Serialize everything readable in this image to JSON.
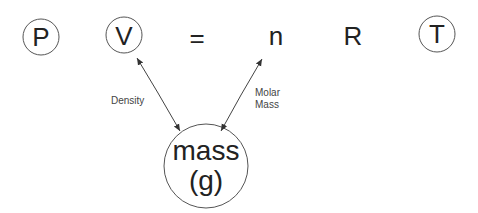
{
  "equation": {
    "terms": [
      {
        "symbol": "P",
        "circled": true
      },
      {
        "symbol": "V",
        "circled": true
      },
      {
        "symbol": "=",
        "circled": false
      },
      {
        "symbol": "n",
        "circled": false
      },
      {
        "symbol": "R",
        "circled": false
      },
      {
        "symbol": "T",
        "circled": true
      }
    ]
  },
  "mass_node": {
    "line1": "mass",
    "line2": "(g)"
  },
  "links": [
    {
      "from": "mass",
      "to": "V",
      "label": "Density"
    },
    {
      "from": "mass",
      "to": "n",
      "label_line1": "Molar",
      "label_line2": "Mass"
    }
  ]
}
